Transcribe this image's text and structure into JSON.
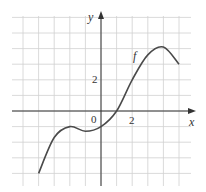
{
  "chart_data": {
    "type": "line",
    "title": "",
    "xlabel": "x",
    "ylabel": "y",
    "curve_label": "f",
    "xlim": [
      -5,
      5
    ],
    "ylim": [
      -4,
      5
    ],
    "grid": true,
    "grid_step": 1,
    "tick_labels": {
      "origin": "0",
      "x": [
        "2"
      ],
      "y": [
        "2"
      ]
    },
    "series": [
      {
        "name": "f",
        "x": [
          -4,
          -3,
          -2,
          -1,
          0,
          1,
          2,
          3,
          4,
          5
        ],
        "y": [
          -4,
          -1.7,
          -1,
          -1.3,
          -1,
          0,
          2,
          3.6,
          4.1,
          3
        ]
      }
    ]
  },
  "labels": {
    "x_axis": "x",
    "y_axis": "y",
    "function": "f",
    "origin": "0",
    "x_tick": "2",
    "y_tick": "2"
  },
  "colors": {
    "grid": "#d0d0d0",
    "axis": "#333333",
    "curve": "#4a4a4a"
  }
}
